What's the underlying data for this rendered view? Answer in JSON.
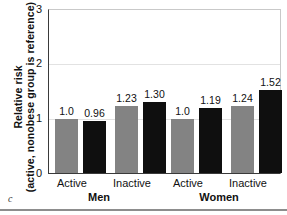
{
  "panel": {
    "letter": "c"
  },
  "chart_data": {
    "type": "bar",
    "title": "",
    "xlabel": "",
    "ylabel": "Relative risk (active, nonobese group is reference)",
    "ylabel_line1": "Relative risk",
    "ylabel_line2": "(active, nonobese group is reference)",
    "ylim": [
      0,
      3
    ],
    "yticks": [
      0,
      1,
      2,
      3
    ],
    "ytick_labels": [
      "0",
      "1",
      "2",
      "3"
    ],
    "grid": true,
    "grid_axis": "y",
    "legend": "none",
    "categories": [
      "Active",
      "Inactive",
      "Active",
      "Inactive"
    ],
    "supercategories": [
      "Men",
      "Women"
    ],
    "series": [
      {
        "name": "nonobese",
        "color": "#838383",
        "values": [
          1.0,
          1.23,
          1.0,
          1.24
        ],
        "labels": [
          "1.0",
          "1.23",
          "1.0",
          "1.24"
        ]
      },
      {
        "name": "obese",
        "color": "#0f0f0f",
        "values": [
          0.96,
          1.3,
          1.19,
          1.52
        ],
        "labels": [
          "0.96",
          "1.30",
          "1.19",
          "1.52"
        ]
      }
    ]
  },
  "axes": {
    "x_tick_labels": [
      "Active",
      "Inactive",
      "Active",
      "Inactive"
    ],
    "group_labels": [
      "Men",
      "Women"
    ]
  }
}
